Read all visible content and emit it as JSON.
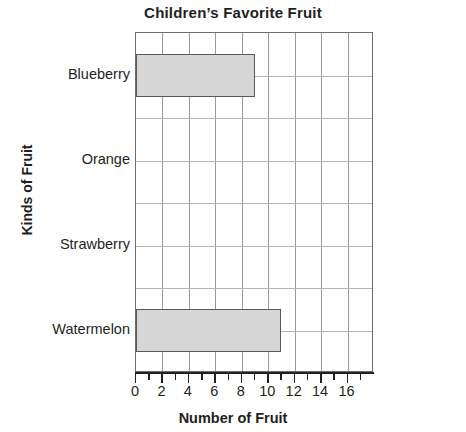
{
  "chart_data": {
    "type": "bar",
    "orientation": "horizontal",
    "title": "Children’s Favorite Fruit",
    "xlabel": "Number of Fruit",
    "ylabel": "Kinds of Fruit",
    "categories": [
      "Blueberry",
      "Orange",
      "Strawberry",
      "Watermelon"
    ],
    "values": [
      9,
      0,
      0,
      11
    ],
    "xlim": [
      0,
      18
    ],
    "xticks": [
      0,
      2,
      4,
      6,
      8,
      10,
      12,
      14,
      16
    ],
    "xtick_labels": [
      "0",
      "2",
      "4",
      "6",
      "8",
      "10",
      "12",
      "14",
      "16"
    ],
    "minor_tick_step": 1,
    "grid": true,
    "grid_vertical_step": 2,
    "grid_rows": 8,
    "legend": null,
    "bar_fill_color": "#d6d6d6",
    "bar_border_color": "#595959",
    "axis_color": "#231f20",
    "grid_color": "#9a9a9a"
  }
}
